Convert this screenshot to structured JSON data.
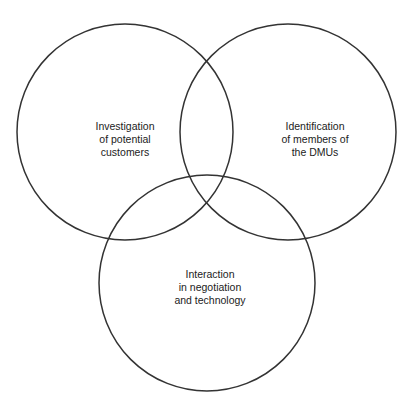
{
  "diagram": {
    "type": "venn",
    "stroke_color": "#333333",
    "text_color": "#222222",
    "background": "#ffffff",
    "sets": [
      {
        "id": "investigation",
        "lines": [
          "Investigation",
          "of potential",
          "customers"
        ],
        "center": [
          125,
          132
        ],
        "radius": 108
      },
      {
        "id": "identification",
        "lines": [
          "Identification",
          "of members of",
          "the DMUs"
        ],
        "center": [
          288,
          132
        ],
        "radius": 108
      },
      {
        "id": "interaction",
        "lines": [
          "Interaction",
          "in negotiation",
          "and technology"
        ],
        "center": [
          207,
          283
        ],
        "radius": 108
      }
    ]
  }
}
